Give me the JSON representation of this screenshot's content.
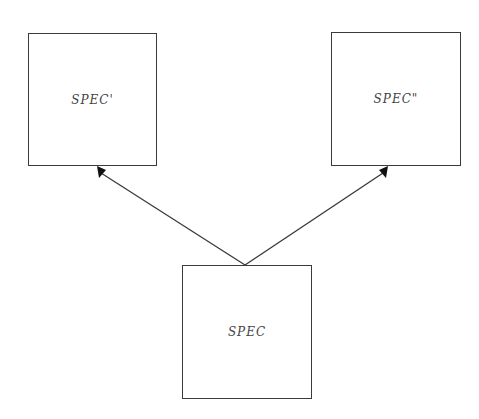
{
  "diagram": {
    "type": "directed-graph",
    "nodes": [
      {
        "id": "spec_prime",
        "label": "SPEC'"
      },
      {
        "id": "spec_dprime",
        "label": "SPEC\""
      },
      {
        "id": "spec",
        "label": "SPEC"
      }
    ],
    "edges": [
      {
        "from": "spec",
        "to": "spec_prime"
      },
      {
        "from": "spec",
        "to": "spec_dprime"
      }
    ],
    "colors": {
      "stroke": "#3a3a3a",
      "text": "#444444",
      "background": "#ffffff"
    }
  }
}
